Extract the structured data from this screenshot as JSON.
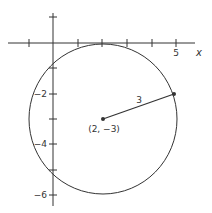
{
  "figure": {
    "colors": {
      "stroke": "#333333",
      "background": "#ffffff"
    },
    "axes": {
      "x_label": "x",
      "x_tick_labels": [
        {
          "value": 5,
          "label": "5"
        }
      ],
      "x_ticks": [
        -1,
        0,
        1,
        2,
        3,
        4,
        5
      ],
      "y_tick_labels": [
        {
          "value": -2,
          "label": "−2"
        },
        {
          "value": -4,
          "label": "−4"
        },
        {
          "value": -6,
          "label": "−6"
        }
      ],
      "y_ticks": [
        1,
        -1,
        -2,
        -3,
        -4,
        -5,
        -6
      ]
    },
    "circle": {
      "center": {
        "x": 2,
        "y": -3
      },
      "radius": 3
    },
    "center_label": "(2, −3)",
    "radius_segment": {
      "from": {
        "x": 2,
        "y": -3
      },
      "to": {
        "x": 4.85,
        "y": -2
      },
      "label": "3"
    }
  }
}
